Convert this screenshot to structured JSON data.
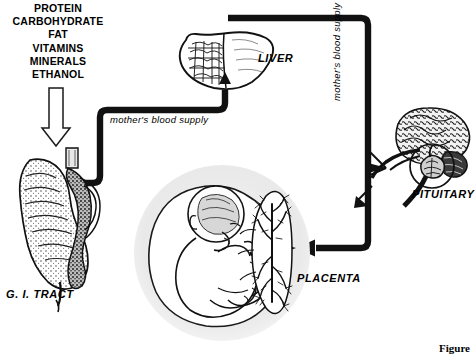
{
  "figure": {
    "caption": "Figure"
  },
  "nutrients": {
    "items": [
      "PROTEIN",
      "CARBOHYDRATE",
      "FAT",
      "VITAMINS",
      "MINERALS",
      "ETHANOL"
    ]
  },
  "labels": {
    "liver": "LIVER",
    "gi_tract": "G. I. TRACT",
    "placenta": "PLACENTA",
    "pituitary": "PITUITARY",
    "flow_left": "mother's  blood  supply",
    "flow_right": "mother's  blood  supply"
  },
  "icons": {
    "intake_arrow": "down-arrow-hollow-icon",
    "gi_tract": "gi-tract-icon",
    "liver": "liver-icon",
    "placenta": "placenta-icon",
    "fetus": "fetus-icon",
    "brain": "brain-icon",
    "pituitary_inset": "pituitary-gland-icon",
    "flow_pipe_left": "blood-vessel-pipe-icon",
    "flow_pipe_right": "blood-vessel-pipe-icon",
    "arrow_to_liver": "arrow-up-icon",
    "arrow_to_placenta": "arrow-left-icon",
    "arrow_to_brain": "arrow-left-icon"
  },
  "colors": {
    "ink": "#000000",
    "paper": "#ffffff",
    "sac_fill": "#ebebeb",
    "organ_mid": "#5a5a5a",
    "organ_light": "#c9c9c9"
  }
}
